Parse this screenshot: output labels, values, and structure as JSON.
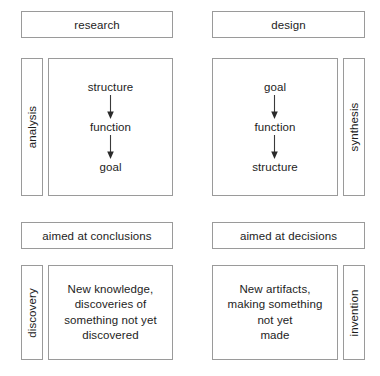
{
  "diagram": {
    "colors": {
      "border": "#9a9a9a",
      "text": "#1d1d1d",
      "background": "#ffffff",
      "arrow": "#3a3a3a"
    },
    "columns": [
      {
        "id": "research",
        "header": "research",
        "side_label": "analysis",
        "side_label_position": "left",
        "flow": [
          "structure",
          "function",
          "goal"
        ],
        "aim_header": "aimed at conclusions",
        "outcome_label": "discovery",
        "outcome_label_position": "left",
        "outcome_lines": [
          "New knowledge,",
          "discoveries of",
          "something not yet",
          "discovered"
        ]
      },
      {
        "id": "design",
        "header": "design",
        "side_label": "synthesis",
        "side_label_position": "right",
        "flow": [
          "goal",
          "function",
          "structure"
        ],
        "aim_header": "aimed at decisions",
        "outcome_label": "invention",
        "outcome_label_position": "right",
        "outcome_lines": [
          "New artifacts,",
          "making something",
          "not yet",
          "made"
        ]
      }
    ]
  }
}
